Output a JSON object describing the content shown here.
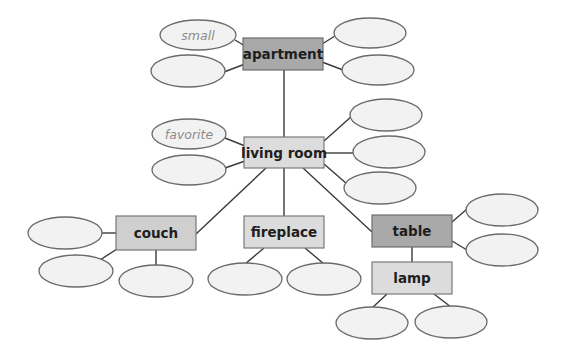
{
  "diagram": {
    "type": "word-web",
    "nodes": {
      "apartment": {
        "label": "apartment",
        "style": "dark"
      },
      "living_room": {
        "label": "living room",
        "style": "light"
      },
      "couch": {
        "label": "couch",
        "style": "mid"
      },
      "fireplace": {
        "label": "fireplace",
        "style": "light"
      },
      "table": {
        "label": "table",
        "style": "dark"
      },
      "lamp": {
        "label": "lamp",
        "style": "light"
      }
    },
    "descriptors": {
      "apartment": [
        "small",
        "",
        "",
        ""
      ],
      "living_room": [
        "favorite",
        "",
        "",
        "",
        ""
      ],
      "couch": [
        "",
        "",
        ""
      ],
      "fireplace": [
        "",
        ""
      ],
      "table": [
        "",
        ""
      ],
      "lamp": [
        "",
        ""
      ]
    },
    "colors": {
      "dark_box": "#a9a9a9",
      "light_box": "#dcdcdc",
      "ellipse_fill": "#f2f2f2",
      "line": "#3a3a3a",
      "example_text": "#8c8c8c"
    }
  }
}
